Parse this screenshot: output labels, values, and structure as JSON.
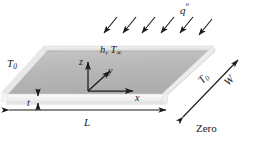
{
  "figure": {
    "domain": "engineering-heat-transfer-schematic",
    "caption_text": "Zero",
    "colors": {
      "plate_top": "#b7b7b7",
      "plate_top_light": "#c9c9c9",
      "plate_edge_light": "#ececec",
      "plate_side": "#f2f2f2",
      "outline": "#9a9a9a",
      "arrow": "#1a1a1a",
      "text": "#1a1a1a",
      "background": "#ffffff"
    },
    "labels": {
      "heat_flux": "q",
      "heat_flux_prime": "ʺ",
      "convection": "h, T",
      "convection_sub": "∞",
      "temp_left": "T",
      "temp_left_sub": "0",
      "temp_right": "T",
      "temp_right_sub": "0",
      "width": "W",
      "length": "L",
      "thickness": "t",
      "axis_x": "x",
      "axis_y": "y",
      "axis_z": "z",
      "footer": "Zero"
    },
    "flux_arrows": {
      "count": 6,
      "direction": "down-left",
      "x_starts": [
        103,
        122,
        141,
        160,
        179,
        198
      ],
      "y_start": 18,
      "dx": -14,
      "dy": 17
    },
    "geometry": {
      "plate_top_face": "parallelogram",
      "plate_corners_top": [
        [
          47,
          50
        ],
        [
          215,
          50
        ],
        [
          168,
          94
        ],
        [
          8,
          94
        ]
      ],
      "length_dim_line": {
        "x1": 9,
        "x2": 166,
        "y": 110
      },
      "thickness_dim_line": {
        "x": 38,
        "y1": 89,
        "y2": 108
      },
      "width_dim_line": {
        "x1": 182,
        "y1": 118,
        "x2": 238,
        "y2": 60
      }
    },
    "axes_origin": {
      "x": 88,
      "y": 91
    }
  }
}
